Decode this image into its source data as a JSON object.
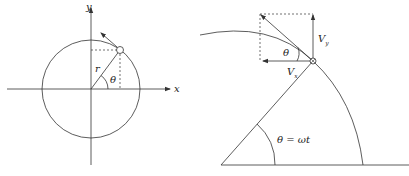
{
  "left_figure": {
    "axis_x_label": "x",
    "axis_y_label": "y",
    "radius_label": "r",
    "angle_label": "θ"
  },
  "right_figure": {
    "vy_label": "V",
    "vy_sub": "y",
    "vx_label": "V",
    "vx_sub": "x",
    "angle_label": "θ",
    "omega_label": "θ = ωt"
  },
  "colors": {
    "stroke": "#333333",
    "background": "#ffffff"
  }
}
